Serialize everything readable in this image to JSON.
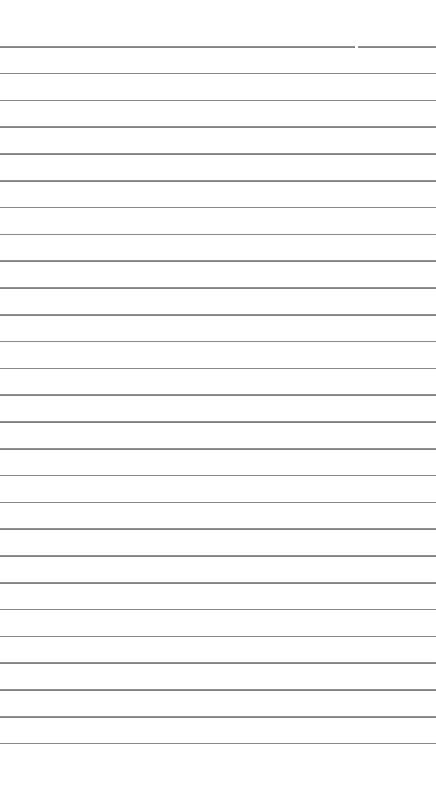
{
  "document": {
    "type": "lined-paper",
    "background_color": "#ffffff",
    "rule_color": "#777777",
    "rule_count": 27,
    "first_rule_y": 46,
    "rule_spacing": 26.8,
    "rule_thickness": 1.5,
    "first_rule_gap_x": 355
  }
}
